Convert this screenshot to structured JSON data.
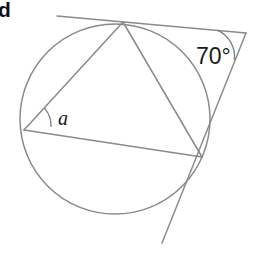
{
  "figure": {
    "part_label": "d",
    "angle_exterior_label": "70°",
    "angle_inscribed_label": "a",
    "colors": {
      "line": "#8a8a8a",
      "text": "#1a1a1a",
      "background": "#ffffff"
    },
    "circle": {
      "center_x": 115,
      "center_y": 119,
      "radius": 95
    },
    "points": {
      "tangent_top": {
        "x": 123,
        "y": 22
      },
      "tangent_right": {
        "x": 202,
        "y": 157
      },
      "vertex_a": {
        "x": 24,
        "y": 130
      },
      "apex_exterior": {
        "x": 246,
        "y": 33
      },
      "tangent_left_end": {
        "x": 57,
        "y": 16
      },
      "tangent_lower_end": {
        "x": 162,
        "y": 243
      }
    },
    "segments": [
      {
        "name": "chord-a-to-top",
        "from": "vertex_a",
        "to": "tangent_top"
      },
      {
        "name": "chord-a-to-right",
        "from": "vertex_a",
        "to": "tangent_right"
      },
      {
        "name": "chord-top-to-right",
        "from": "tangent_top",
        "to": "tangent_right"
      },
      {
        "name": "tangent-upper",
        "from": "tangent_left_end",
        "to": "apex_exterior"
      },
      {
        "name": "tangent-lower",
        "from": "apex_exterior",
        "to": "tangent_lower_end"
      }
    ]
  }
}
